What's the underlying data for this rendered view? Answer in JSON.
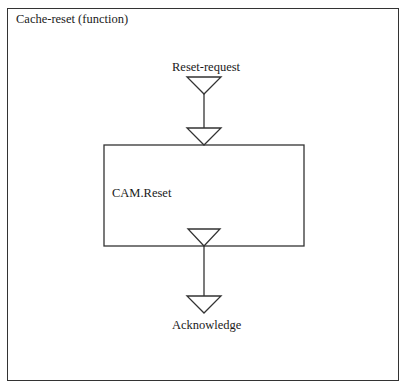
{
  "frame": {
    "title": "Cache-reset (function)"
  },
  "diagram": {
    "input_port": {
      "label": "Reset-request"
    },
    "process": {
      "label": "CAM.Reset"
    },
    "output_port": {
      "label": "Acknowledge"
    }
  },
  "colors": {
    "stroke": "#333333",
    "text": "#1a1a1a",
    "background": "#ffffff"
  }
}
